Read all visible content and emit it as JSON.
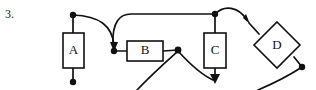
{
  "figure": {
    "item_number": "3.",
    "canvas": {
      "width": 316,
      "height": 90
    },
    "stroke_color": "#111111",
    "fill_color": "#ffffff",
    "nodes": [
      {
        "id": "A",
        "label": "A",
        "shape": "rectangle",
        "x": 63,
        "y": 33,
        "width": 21,
        "height": 35,
        "cx": 73.5,
        "cy": 50.5
      },
      {
        "id": "B",
        "label": "B",
        "shape": "rectangle",
        "x": 127,
        "y": 41,
        "width": 36,
        "height": 20,
        "cx": 145,
        "cy": 51
      },
      {
        "id": "C",
        "label": "C",
        "shape": "rectangle",
        "x": 204,
        "y": 33,
        "width": 22,
        "height": 35,
        "cx": 215,
        "cy": 50.5
      },
      {
        "id": "D",
        "label": "D",
        "shape": "diamond",
        "cx": 277,
        "cy": 45,
        "rx": 24,
        "ry": 22
      }
    ],
    "junction_dots": [
      {
        "name": "dot-above-a",
        "x": 73,
        "y": 15
      },
      {
        "name": "dot-below-a",
        "x": 73,
        "y": 82
      },
      {
        "name": "dot-left-of-b",
        "x": 114,
        "y": 51
      },
      {
        "name": "dot-right-of-b",
        "x": 178,
        "y": 50
      },
      {
        "name": "dot-above-c",
        "x": 215,
        "y": 14
      },
      {
        "name": "dot-lower-right-of-d",
        "x": 302,
        "y": 67
      }
    ],
    "arrowheads": [
      {
        "name": "arrowhead-into-left-of-b",
        "x": 114,
        "y": 50,
        "angle": 105
      },
      {
        "name": "arrowhead-into-d-upper-left",
        "x": 249,
        "y": 23,
        "angle": 47
      },
      {
        "name": "arrowhead-below-c",
        "x": 215,
        "y": 83,
        "angle": 90
      },
      {
        "name": "arrowhead-into-right-of-b-junction",
        "x": 178,
        "y": 50,
        "angle": 300
      }
    ],
    "edges": [
      {
        "name": "edge-a-top-stub",
        "from": "dot-above-a",
        "to": "A-top",
        "style": "straight"
      },
      {
        "name": "edge-a-bottom-stub",
        "from": "A-bottom",
        "to": "dot-below-a",
        "style": "straight"
      },
      {
        "name": "edge-a-top-to-b-left",
        "from": "dot-above-a",
        "to": "dot-left-of-b",
        "style": "curved"
      },
      {
        "name": "edge-top-rail-to-b-left",
        "from": "dot-above-c",
        "to": "dot-left-of-b",
        "style": "curved"
      },
      {
        "name": "edge-b-left-to-b",
        "from": "dot-left-of-b",
        "to": "B-left",
        "style": "straight"
      },
      {
        "name": "edge-b-to-b-right",
        "from": "B-right",
        "to": "dot-right-of-b",
        "style": "straight"
      },
      {
        "name": "edge-c-top-stub",
        "from": "dot-above-c",
        "to": "C-top",
        "style": "straight"
      },
      {
        "name": "edge-c-bottom-to-arrow",
        "from": "C-bottom",
        "to": "arrowhead-below-c",
        "style": "straight"
      },
      {
        "name": "edge-b-right-curve-down-left",
        "from": "dot-right-of-b",
        "to": "bottom-left-offscreen",
        "style": "curved"
      },
      {
        "name": "edge-b-right-curve-down-right",
        "from": "dot-right-of-b",
        "to": "arrowhead-below-c",
        "style": "curved"
      },
      {
        "name": "edge-c-top-to-d",
        "from": "dot-above-c",
        "to": "D-upper-left",
        "style": "curved"
      },
      {
        "name": "edge-d-to-lower-right-dot",
        "from": "D-lower-right",
        "to": "dot-lower-right-of-d",
        "style": "straight"
      },
      {
        "name": "edge-lower-right-dot-curve",
        "from": "dot-lower-right-of-d",
        "to": "bottom-offscreen",
        "style": "curved"
      }
    ]
  }
}
